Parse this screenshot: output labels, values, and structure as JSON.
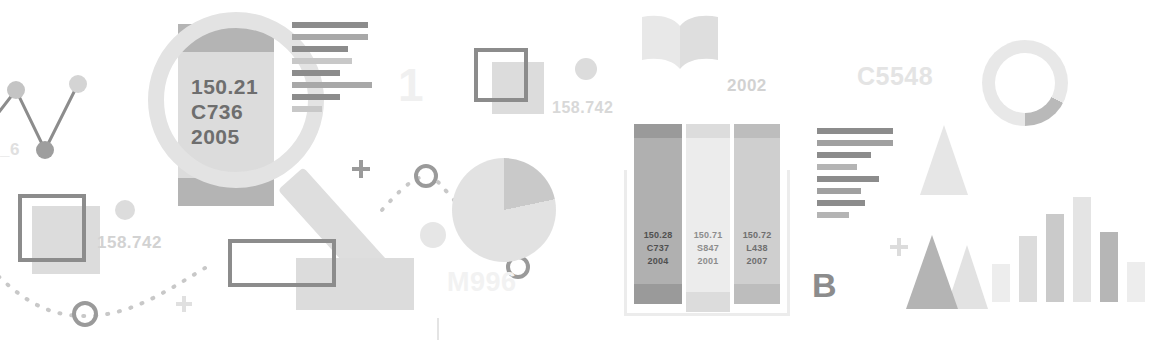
{
  "meta": {
    "background": "#ffffff"
  },
  "palette": {
    "dark_gray": "#6e6e6e",
    "mid_gray": "#8c8c8c",
    "light_gray": "#dcdcdc",
    "pale_gray": "#ececec",
    "faint_gray": "#f2f2f2"
  },
  "magnifier": {
    "name": "magnifying-glass-over-book-spine",
    "spine_label": {
      "call_number": "150.21",
      "author_code": "C736",
      "year": "2005"
    }
  },
  "watermarks": [
    {
      "text": "_6",
      "color": "#e0e0e0",
      "size": 17,
      "x": 0,
      "y": 140
    },
    {
      "text": "158.742",
      "color": "#d2d2d2",
      "size": 17,
      "x": 97,
      "y": 233
    },
    {
      "text": "1",
      "color": "#f0f0f0",
      "size": 46,
      "x": 398,
      "y": 58
    },
    {
      "text": "158.742",
      "color": "#d8d8d8",
      "size": 16,
      "x": 552,
      "y": 99
    },
    {
      "text": "M996",
      "color": "#f2f2f2",
      "size": 27,
      "x": 447,
      "y": 267
    },
    {
      "text": "2002",
      "color": "#d2d2d2",
      "size": 17,
      "x": 727,
      "y": 76
    },
    {
      "text": "C5548",
      "color": "#e4e4e4",
      "size": 25,
      "x": 857,
      "y": 62
    },
    {
      "text": "B",
      "color": "#8c8c8c",
      "size": 34,
      "x": 812,
      "y": 266
    }
  ],
  "line_chart": {
    "name": "zigzag-line-chart",
    "points": [
      {
        "x": 0,
        "y": 68
      },
      {
        "x": 30,
        "y": 18
      },
      {
        "x": 59,
        "y": 78
      },
      {
        "x": 92,
        "y": 14
      }
    ],
    "marker_color": "#c4c4c4",
    "line_color": "#8c8c8c"
  },
  "text_blocks": [
    {
      "name": "text-lines-upper",
      "x": 292,
      "y": 22,
      "lines": [
        {
          "width": 76,
          "color": "#8c8c8c"
        },
        {
          "width": 76,
          "color": "#a8a8a8"
        },
        {
          "width": 56,
          "color": "#8c8c8c"
        },
        {
          "width": 60,
          "color": "#c8c8c8"
        },
        {
          "width": 48,
          "color": "#8c8c8c"
        },
        {
          "width": 80,
          "color": "#a8a8a8"
        },
        {
          "width": 48,
          "color": "#8c8c8c"
        },
        {
          "width": 30,
          "color": "#c8c8c8"
        }
      ]
    },
    {
      "name": "text-lines-lower",
      "x": 817,
      "y": 128,
      "lines": [
        {
          "width": 76,
          "color": "#8c8c8c"
        },
        {
          "width": 76,
          "color": "#a0a0a0"
        },
        {
          "width": 54,
          "color": "#8c8c8c"
        },
        {
          "width": 40,
          "color": "#b4b4b4"
        },
        {
          "width": 62,
          "color": "#8c8c8c"
        },
        {
          "width": 44,
          "color": "#a0a0a0"
        },
        {
          "width": 48,
          "color": "#8c8c8c"
        },
        {
          "width": 32,
          "color": "#b4b4b4"
        }
      ]
    }
  ],
  "shelf": {
    "name": "three-book-spines-on-shelf",
    "spines": [
      {
        "call_number": "150.28",
        "author_code": "C737",
        "year": "2004",
        "body_color": "#b0b0b0",
        "cap_color": "#9a9a9a",
        "text_color": "#4f4f4f",
        "x": 0,
        "width": 48,
        "height": 180
      },
      {
        "call_number": "150.71",
        "author_code": "S847",
        "year": "2001",
        "body_color": "#ececec",
        "cap_color": "#dcdcdc",
        "text_color": "#8c8c8c",
        "x": 52,
        "width": 44,
        "height": 188
      },
      {
        "call_number": "150.72",
        "author_code": "L438",
        "year": "2007",
        "body_color": "#cfcfcf",
        "cap_color": "#bdbdbd",
        "text_color": "#6e6e6e",
        "x": 100,
        "width": 46,
        "height": 180
      }
    ]
  },
  "bar_chart": {
    "name": "gray-bar-chart",
    "bars": [
      {
        "height": 38,
        "color": "#ededed"
      },
      {
        "height": 66,
        "color": "#dcdcdc"
      },
      {
        "height": 88,
        "color": "#cacaca"
      },
      {
        "height": 105,
        "color": "#e4e4e4"
      },
      {
        "height": 70,
        "color": "#b6b6b6"
      },
      {
        "height": 40,
        "color": "#ededed"
      }
    ]
  },
  "triangles": [
    {
      "name": "triangle-top",
      "color": "#e6e6e6",
      "x": 920,
      "y": 125,
      "w": 46,
      "h": 68
    },
    {
      "name": "triangle-dark-front",
      "color": "#b4b4b4",
      "x": 908,
      "y": 235,
      "w": 50,
      "h": 72
    },
    {
      "name": "triangle-light-back",
      "color": "#e0e0e0",
      "x": 948,
      "y": 245,
      "w": 40,
      "h": 62
    }
  ],
  "pie_chart": {
    "name": "pie-chart",
    "base_color": "#e0e0e0",
    "wedge_color": "#cccccc",
    "slices": [
      {
        "label": "wedge",
        "percent": 22
      },
      {
        "label": "remainder",
        "percent": 78
      }
    ]
  },
  "donut_chart": {
    "name": "donut-chart",
    "ring_color": "#e8e8e8",
    "segment_color": "#b9b9b9",
    "segment_percent": 18
  },
  "book_icon": {
    "name": "open-book-icon",
    "color": "#e6e6e6"
  },
  "plus_markers": [
    {
      "name": "plus-marker-left",
      "x": 176,
      "y": 296,
      "size": 16,
      "color": "#e0e0e0"
    },
    {
      "name": "plus-marker-mid",
      "x": 352,
      "y": 160,
      "size": 18,
      "color": "#9a9a9a"
    },
    {
      "name": "plus-marker-right",
      "x": 890,
      "y": 238,
      "size": 18,
      "color": "#dcdcdc"
    }
  ],
  "dots": [
    {
      "name": "dot-large-top",
      "x": 575,
      "y": 58,
      "size": 22,
      "color": "#dcdcdc"
    },
    {
      "name": "dot-medium-left",
      "x": 115,
      "y": 200,
      "size": 20,
      "color": "#dcdcdc"
    },
    {
      "name": "dot-medium-mid",
      "x": 420,
      "y": 222,
      "size": 26,
      "color": "#e6e6e6"
    }
  ]
}
